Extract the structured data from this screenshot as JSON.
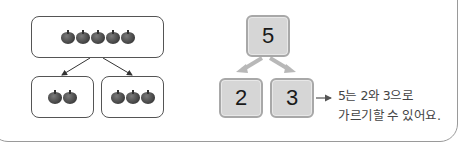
{
  "left_diagram": {
    "whole": {
      "count": 5,
      "icon": "apple-icon"
    },
    "parts": [
      {
        "count": 2,
        "icon": "apple-icon"
      },
      {
        "count": 3,
        "icon": "apple-icon"
      }
    ]
  },
  "number_bond": {
    "whole": "5",
    "parts": [
      "2",
      "3"
    ]
  },
  "caption": {
    "line1": "5는 2와 3으로",
    "line2": "가르기할 수 있어요."
  },
  "colors": {
    "number_box_fill": "#d6d6d6",
    "number_box_border": "#a8a8a8",
    "apple": "#4a4a4a",
    "frame_border": "#9a9a9a"
  }
}
